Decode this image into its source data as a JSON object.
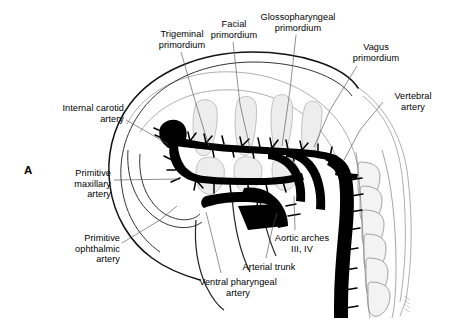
{
  "figure": {
    "panel_letter": "A",
    "background_color": "#ffffff",
    "ink_color": "#000000",
    "vessel_color": "#000000",
    "outline_color": "#1a1a1a",
    "faint_color": "#9a9a9a",
    "tissue_fill": "#e9e9e9",
    "leader_color": "#666666",
    "width": 451,
    "height": 332
  },
  "labels": [
    {
      "name": "trigeminal-primordium",
      "text": "Trigeminal\nprimordium",
      "x": 146,
      "y": 29,
      "w": 72,
      "align": "center"
    },
    {
      "name": "facial-primordium",
      "text": "Facial\nprimordium",
      "x": 203,
      "y": 19,
      "w": 62,
      "align": "center"
    },
    {
      "name": "glossopharyngeal-primordium",
      "text": "Glossopharyngeal\nprimordium",
      "x": 252,
      "y": 12,
      "w": 92,
      "align": "center"
    },
    {
      "name": "vagus-primordium",
      "text": "Vagus\nprimordium",
      "x": 343,
      "y": 42,
      "w": 66,
      "align": "center"
    },
    {
      "name": "vertebral-artery",
      "text": "Vertebral\nartery",
      "x": 385,
      "y": 91,
      "w": 56,
      "align": "center"
    },
    {
      "name": "internal-carotid-artery",
      "text": "Internal carotid\nartery",
      "x": 38,
      "y": 103,
      "w": 86,
      "align": "right"
    },
    {
      "name": "primitive-maxillary-artery",
      "text": "Primitive\nmaxillary\nartery",
      "x": 57,
      "y": 168,
      "w": 54,
      "align": "right"
    },
    {
      "name": "primitive-ophthalmic-artery",
      "text": "Primitive\nophthalmic\nartery",
      "x": 58,
      "y": 233,
      "w": 62,
      "align": "right"
    },
    {
      "name": "aortic-arches",
      "text": "Aortic arches\nIII, IV",
      "x": 262,
      "y": 233,
      "w": 80,
      "align": "center"
    },
    {
      "name": "arterial-trunk",
      "text": "Arterial trunk",
      "x": 233,
      "y": 262,
      "w": 72,
      "align": "center"
    },
    {
      "name": "ventral-pharyngeal-artery",
      "text": "Ventral pharyngeal\nartery",
      "x": 186,
      "y": 277,
      "w": 104,
      "align": "center"
    }
  ],
  "leaders": [
    {
      "name": "leader-trigeminal",
      "d": "M 181 52 L 196 104 L 209 146"
    },
    {
      "name": "leader-facial",
      "d": "M 233 42 L 240 104 L 250 148"
    },
    {
      "name": "leader-glossopharyngeal",
      "d": "M 296 35 L 290 90 L 282 146"
    },
    {
      "name": "leader-vagus",
      "d": "M 357 66 L 330 110 L 314 147"
    },
    {
      "name": "leader-vertebral",
      "d": "M 385 100 L 360 130 L 344 160"
    },
    {
      "name": "leader-internal-carotid",
      "d": "M 126 120 L 168 146"
    },
    {
      "name": "leader-maxillary",
      "d": "M 113 180 L 180 180"
    },
    {
      "name": "leader-ophthalmic",
      "d": "M 121 243 L 160 220 L 176 205"
    },
    {
      "name": "leader-aortic-arches",
      "d": "M 295 228 L 294 196"
    },
    {
      "name": "leader-arterial-trunk",
      "d": "M 266 258 L 272 230 L 276 212"
    },
    {
      "name": "leader-ventral-pharyngeal",
      "d": "M 220 273 L 212 235 L 206 212"
    }
  ],
  "structures": {
    "head_outline": "embryo-head-outline",
    "dorsal_aorta": "dorsal-aorta",
    "somites": "somite-column",
    "aortic_arches": "aortic-arch-loops",
    "nerve_primordia": "cranial-nerve-primordia",
    "signature": "artist-signature"
  }
}
